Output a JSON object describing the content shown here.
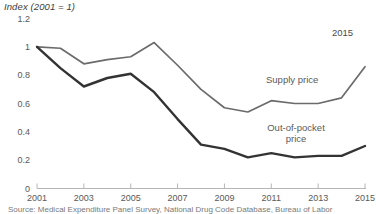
{
  "chart_data": {
    "type": "line",
    "title": "Index (2001 = 1)",
    "xlabel": "",
    "ylabel": "Index (2001 = 1)",
    "x": [
      2001,
      2002,
      2003,
      2004,
      2005,
      2006,
      2007,
      2008,
      2009,
      2010,
      2011,
      2012,
      2013,
      2014,
      2015
    ],
    "xlim": [
      2001,
      2015
    ],
    "ylim": [
      0,
      1.2
    ],
    "yticks": [
      0,
      0.2,
      0.4,
      0.6,
      0.8,
      1,
      1.2
    ],
    "ytick_labels": [
      "0",
      "0.2",
      "0.4",
      "0.6",
      "0.8",
      "1",
      "1.2"
    ],
    "xticks": [
      2001,
      2003,
      2005,
      2007,
      2009,
      2011,
      2013,
      2015
    ],
    "xtick_labels": [
      "2001",
      "2003",
      "2005",
      "2007",
      "2009",
      "2011",
      "2013",
      "2015"
    ],
    "grid": false,
    "legend_position": "inline-annotation",
    "series": [
      {
        "name": "Supply price",
        "color": "#6b6b6b",
        "width": 1.7,
        "values": [
          1.0,
          0.99,
          0.88,
          0.91,
          0.93,
          1.03,
          0.87,
          0.7,
          0.57,
          0.54,
          0.62,
          0.6,
          0.6,
          0.64,
          0.86
        ]
      },
      {
        "name": "Out-of-pocket price",
        "color": "#333333",
        "width": 2.4,
        "values": [
          1.0,
          0.85,
          0.72,
          0.78,
          0.81,
          0.68,
          0.49,
          0.31,
          0.28,
          0.22,
          0.25,
          0.22,
          0.23,
          0.23,
          0.3
        ]
      }
    ],
    "annotations": [
      {
        "text": "2015",
        "x": 2015,
        "y": 1.15
      },
      {
        "text": "Supply price",
        "x": 2011.6,
        "y": 0.62
      },
      {
        "text": "Out-of-pocket price",
        "x": 2011.2,
        "y": 0.38
      }
    ]
  },
  "labels": {
    "axis_title": "Index (2001 = 1)",
    "supply_series": "Supply price",
    "oop_series_line1": "Out-of-pocket",
    "oop_series_line2": "price",
    "end_year": "2015"
  },
  "source": {
    "note": "Source: Medical Expenditure Panel Survey, National Drug Code Database, Bureau of Labor"
  }
}
